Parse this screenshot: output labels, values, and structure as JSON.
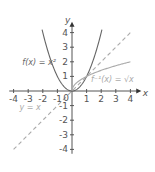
{
  "chart_data": {
    "type": "line",
    "title": "",
    "xlabel": "x",
    "ylabel": "y",
    "xlim": [
      -4,
      4
    ],
    "ylim": [
      -4,
      4
    ],
    "grid": false,
    "x_ticks": [
      "-4",
      "-3",
      "-2",
      "-1",
      "0",
      "1",
      "2",
      "3",
      "4"
    ],
    "y_ticks": [
      "4",
      "3",
      "2",
      "1",
      "-1",
      "-2",
      "-3",
      "-4"
    ],
    "origin_label": "0",
    "series": [
      {
        "name": "f(x) = x²",
        "function": "x^2",
        "domain": [
          -2.05,
          2.05
        ],
        "style": "solid",
        "color": "#666666"
      },
      {
        "name": "f⁻¹(x) = √x",
        "function": "sqrt(x)",
        "domain": [
          0,
          4
        ],
        "style": "solid",
        "color": "#aaaaaa"
      },
      {
        "name": "y = x",
        "function": "x",
        "domain": [
          -4,
          4
        ],
        "style": "dashed",
        "color": "#aaaaaa"
      }
    ],
    "annotations": [
      {
        "id": "fx",
        "text": "f(x) = x²",
        "x": -3.4,
        "y": 1.8,
        "color": "#666666"
      },
      {
        "id": "finv",
        "text": "f⁻¹(x) = √x",
        "x": 1.3,
        "y": 0.65,
        "color": "#aaaaaa"
      },
      {
        "id": "yx",
        "text": "y = x",
        "x": -3.6,
        "y": -1.3,
        "color": "#aaaaaa"
      }
    ]
  }
}
